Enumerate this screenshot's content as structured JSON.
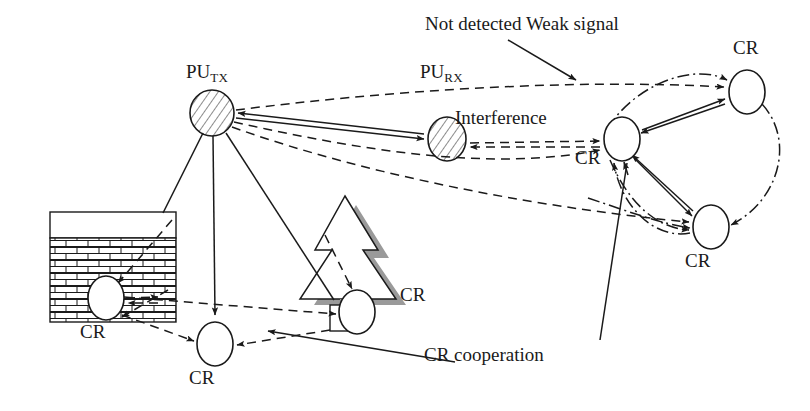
{
  "figure": {
    "background_color": "#ffffff",
    "stroke_color": "#1a1a1a",
    "shadow_color": "#9a9a9a",
    "width": 810,
    "height": 411
  },
  "nodes": [
    {
      "id": "pu_tx",
      "label_main": "PU",
      "label_sub": "TX",
      "kind": "primary-user-transmitter",
      "fill": "hatched",
      "cx": 212,
      "cy": 113,
      "rx": 22,
      "ry": 23,
      "label_x": 186,
      "label_y": 62
    },
    {
      "id": "pu_rx",
      "label_main": "PU",
      "label_sub": "RX",
      "kind": "primary-user-receiver",
      "fill": "hatched",
      "cx": 447,
      "cy": 139,
      "rx": 19,
      "ry": 22,
      "label_x": 420,
      "label_y": 62
    },
    {
      "id": "cr_building",
      "label_main": "CR",
      "label_sub": "",
      "kind": "cognitive-radio",
      "fill": "white",
      "cx": 106,
      "cy": 298,
      "rx": 18,
      "ry": 22,
      "label_x": 80,
      "label_y": 322
    },
    {
      "id": "cr_bottom",
      "label_main": "CR",
      "label_sub": "",
      "kind": "cognitive-radio",
      "fill": "white",
      "cx": 215,
      "cy": 344,
      "rx": 18,
      "ry": 22,
      "label_x": 189,
      "label_y": 368
    },
    {
      "id": "cr_tree",
      "label_main": "CR",
      "label_sub": "",
      "kind": "cognitive-radio",
      "fill": "white",
      "cx": 357,
      "cy": 312,
      "rx": 18,
      "ry": 22,
      "label_x": 400,
      "label_y": 285
    },
    {
      "id": "cr_mid",
      "label_main": "CR",
      "label_sub": "",
      "kind": "cognitive-radio",
      "fill": "white",
      "cx": 622,
      "cy": 139,
      "rx": 18,
      "ry": 22,
      "label_x": 575,
      "label_y": 148
    },
    {
      "id": "cr_top",
      "label_main": "CR",
      "label_sub": "",
      "kind": "cognitive-radio",
      "fill": "white",
      "cx": 747,
      "cy": 92,
      "rx": 18,
      "ry": 22,
      "label_x": 733,
      "label_y": 38
    },
    {
      "id": "cr_low",
      "label_main": "CR",
      "label_sub": "",
      "kind": "cognitive-radio",
      "fill": "white",
      "cx": 711,
      "cy": 227,
      "rx": 18,
      "ry": 22,
      "label_x": 685,
      "label_y": 251
    }
  ],
  "annotations": [
    {
      "id": "not_detected",
      "text": "Not detected Weak signal",
      "x": 425,
      "y": 14
    },
    {
      "id": "interference",
      "text": "Interference",
      "x": 455,
      "y": 108
    },
    {
      "id": "cr_cooperation",
      "text": "CR cooperation",
      "x": 424,
      "y": 345
    }
  ],
  "scenery": {
    "building": {
      "name": "brick-building",
      "x": 50,
      "y": 212,
      "width": 126,
      "height": 110,
      "roof_height": 26,
      "brick_rows": 9,
      "brick_cols": 6
    },
    "tree": {
      "name": "pine-tree",
      "apex_x": 345,
      "apex_y": 196,
      "tiers": 3,
      "trunk_x": 330,
      "trunk_y": 305,
      "trunk_w": 27,
      "trunk_h": 30
    }
  },
  "legend": {
    "solid": "detected / strong signal link",
    "dashed": "weak or interference signal",
    "dash_dot": "CR cooperation link"
  }
}
